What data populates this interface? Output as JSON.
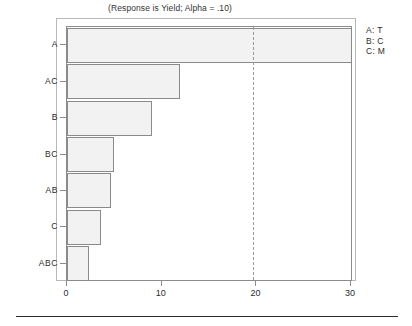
{
  "chart_data": {
    "type": "bar",
    "orientation": "horizontal",
    "title": "(Response is Yield; Alpha = .10)",
    "xlabel": "",
    "ylabel": "",
    "categories": [
      "A",
      "AC",
      "B",
      "BC",
      "AB",
      "C",
      "ABC"
    ],
    "values": [
      30.1,
      11.9,
      9.0,
      5.0,
      4.6,
      3.6,
      2.3
    ],
    "xlim": [
      0,
      30.2
    ],
    "xticks": [
      0,
      10,
      20,
      30
    ],
    "xtick_labels": [
      "0",
      "10",
      "20",
      "30"
    ],
    "grid": false,
    "reference_line": {
      "value": 19.6,
      "style": "dashed",
      "label": ""
    },
    "legend": {
      "position": "top-right",
      "entries": [
        "A: T",
        "B: C",
        "C: M"
      ]
    },
    "colors": {
      "bar_fill": "#f2f2f2",
      "bar_border": "#8a8a8a",
      "axis": "#8c8c8c",
      "frame": "#b8b8b8",
      "reference_line": "#9a9a9a",
      "text": "#2b2b2b",
      "rule": "#2d2d2d"
    }
  }
}
